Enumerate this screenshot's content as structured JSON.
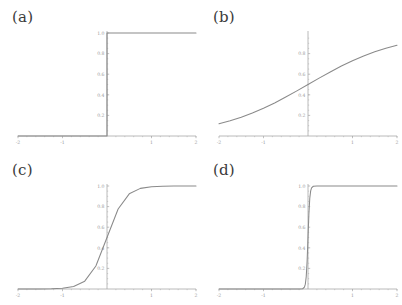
{
  "figure": {
    "background_color": "#ffffff",
    "curve_color": "#8a8a8a",
    "axis_color": "#a8a8a8",
    "tick_label_color": "#9a9a9a",
    "panel_label_color": "#3b3b3b"
  },
  "panels": [
    {
      "id": "a",
      "label": "(a)"
    },
    {
      "id": "b",
      "label": "(b)"
    },
    {
      "id": "c",
      "label": "(c)"
    },
    {
      "id": "d",
      "label": "(d)"
    }
  ],
  "chart_data": [
    {
      "type": "line",
      "id": "a",
      "title": "(a)",
      "xlabel": "",
      "ylabel": "",
      "xlim": [
        -2,
        2
      ],
      "ylim": [
        0,
        1
      ],
      "grid": false,
      "legend": "none",
      "xticks": [
        -2,
        -1,
        1,
        2
      ],
      "xtick_labels": [
        "-2",
        "-1",
        "1",
        "2"
      ],
      "yticks": [
        0.2,
        0.4,
        0.6,
        0.8,
        1.0
      ],
      "ytick_labels": [
        "0.2",
        "0.4",
        "0.6",
        "0.8",
        "1.0"
      ],
      "description": "Heaviside unit step: 0 for x<0, 1 for x>0",
      "series": [
        {
          "name": "step",
          "x": [
            -2.0,
            -1.5,
            -1.0,
            -0.5,
            -0.1,
            -0.01,
            0.0,
            0.0,
            0.01,
            0.1,
            0.5,
            1.0,
            1.5,
            2.0
          ],
          "values": [
            0,
            0,
            0,
            0,
            0,
            0,
            0,
            1,
            1,
            1,
            1,
            1,
            1,
            1
          ]
        }
      ]
    },
    {
      "type": "line",
      "id": "b",
      "title": "(b)",
      "xlabel": "",
      "ylabel": "",
      "xlim": [
        -2,
        2
      ],
      "ylim": [
        0,
        1
      ],
      "grid": false,
      "legend": "none",
      "xticks": [
        -2,
        -1,
        1,
        2
      ],
      "xtick_labels": [
        "-2",
        "-1",
        "1",
        "2"
      ],
      "yticks": [
        0.2,
        0.4,
        0.6,
        0.8
      ],
      "ytick_labels": [
        "0.2",
        "0.4",
        "0.6",
        "0.8"
      ],
      "description": "Logistic sigmoid 1/(1+exp(-x)), gentle slope k=1",
      "series": [
        {
          "name": "sigmoid-k1",
          "x": [
            -2.0,
            -1.75,
            -1.5,
            -1.25,
            -1.0,
            -0.75,
            -0.5,
            -0.25,
            0.0,
            0.25,
            0.5,
            0.75,
            1.0,
            1.25,
            1.5,
            1.75,
            2.0
          ],
          "values": [
            0.119,
            0.148,
            0.182,
            0.223,
            0.269,
            0.321,
            0.378,
            0.438,
            0.5,
            0.562,
            0.622,
            0.679,
            0.731,
            0.777,
            0.818,
            0.852,
            0.881
          ]
        }
      ]
    },
    {
      "type": "line",
      "id": "c",
      "title": "(c)",
      "xlabel": "",
      "ylabel": "",
      "xlim": [
        -2,
        2
      ],
      "ylim": [
        0,
        1
      ],
      "grid": false,
      "legend": "none",
      "xticks": [
        -2,
        -1,
        1,
        2
      ],
      "xtick_labels": [
        "-2",
        "-1",
        "1",
        "2"
      ],
      "yticks": [
        0.2,
        0.4,
        0.6,
        0.8,
        1.0
      ],
      "ytick_labels": [
        "0.2",
        "0.4",
        "0.6",
        "0.8",
        "1.0"
      ],
      "description": "Logistic sigmoid 1/(1+exp(-5x)), steep slope k=5",
      "series": [
        {
          "name": "sigmoid-k5",
          "x": [
            -2.0,
            -1.75,
            -1.5,
            -1.25,
            -1.0,
            -0.75,
            -0.5,
            -0.25,
            0.0,
            0.25,
            0.5,
            0.75,
            1.0,
            1.25,
            1.5,
            1.75,
            2.0
          ],
          "values": [
            5e-05,
            0.00016,
            0.00055,
            0.0019,
            0.0067,
            0.0235,
            0.076,
            0.223,
            0.5,
            0.777,
            0.924,
            0.977,
            0.993,
            0.998,
            0.9994,
            0.9998,
            0.99995
          ]
        }
      ]
    },
    {
      "type": "line",
      "id": "d",
      "title": "(d)",
      "xlabel": "",
      "ylabel": "",
      "xlim": [
        -2,
        2
      ],
      "ylim": [
        0,
        1
      ],
      "grid": false,
      "legend": "none",
      "xticks": [
        -2,
        -1,
        1,
        2
      ],
      "xtick_labels": [
        "-2",
        "-1",
        "1",
        "2"
      ],
      "yticks": [
        0.2,
        0.4,
        0.6,
        0.8,
        1.0
      ],
      "ytick_labels": [
        "0.2",
        "0.4",
        "0.6",
        "0.8",
        "1.0"
      ],
      "description": "Logistic sigmoid 1/(1+exp(-50x)), near-step slope k=50",
      "series": [
        {
          "name": "sigmoid-k50",
          "x": [
            -2.0,
            -1.0,
            -0.5,
            -0.2,
            -0.12,
            -0.08,
            -0.06,
            -0.04,
            -0.02,
            0.0,
            0.02,
            0.04,
            0.06,
            0.08,
            0.12,
            0.2,
            0.5,
            1.0,
            2.0
          ],
          "values": [
            0.0,
            0.0,
            0.0,
            5e-05,
            0.0025,
            0.018,
            0.047,
            0.119,
            0.269,
            0.5,
            0.731,
            0.881,
            0.953,
            0.982,
            0.9975,
            0.99995,
            1.0,
            1.0,
            1.0
          ]
        }
      ]
    }
  ]
}
